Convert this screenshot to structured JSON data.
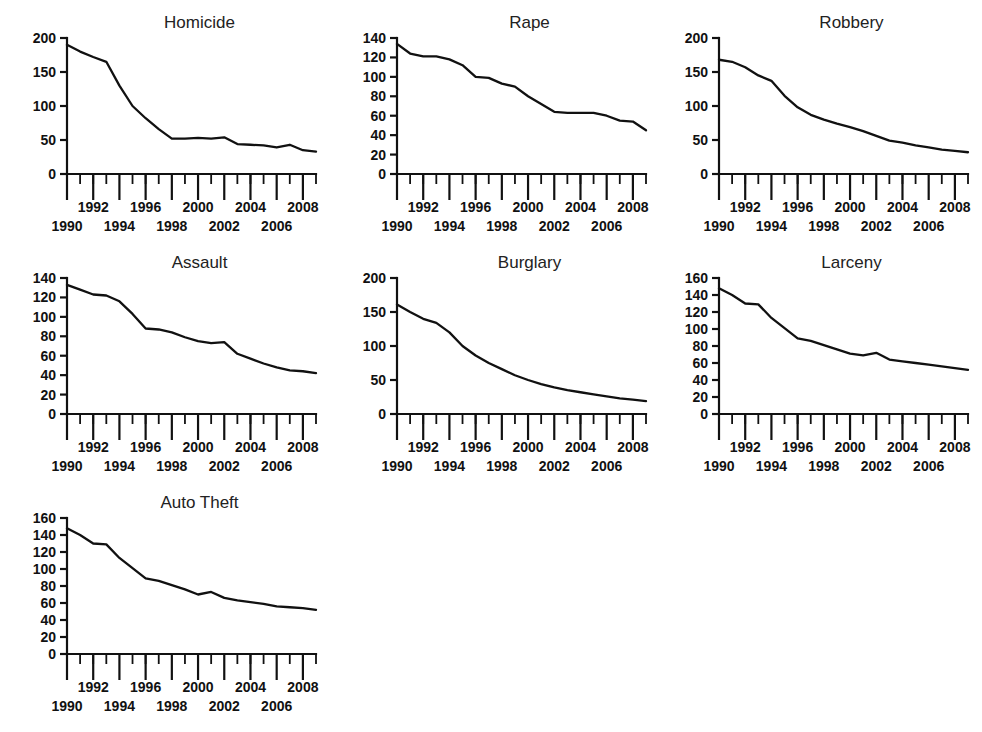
{
  "page": {
    "background": "#ffffff",
    "line_color": "#111111",
    "text_color": "#111111",
    "layout": "3-column grid of 7 small-multiple line charts"
  },
  "chart_data": [
    {
      "type": "line",
      "title": "Homicide",
      "xlabel": "",
      "ylabel": "",
      "xlim": [
        1990,
        2009
      ],
      "ylim": [
        0,
        200
      ],
      "yticks": [
        0,
        50,
        100,
        150,
        200
      ],
      "xticks_major": [
        1990,
        1992,
        1994,
        1996,
        1998,
        2000,
        2002,
        2004,
        2006,
        2008
      ],
      "xtick_labels_upper": [
        "1992",
        "1996",
        "2000",
        "2004",
        "2008"
      ],
      "xtick_labels_lower": [
        "1990",
        "1994",
        "1998",
        "2002",
        "2006"
      ],
      "grid": false,
      "legend": "none",
      "x": [
        1990,
        1991,
        1992,
        1993,
        1994,
        1995,
        1996,
        1997,
        1998,
        1999,
        2000,
        2001,
        2002,
        2003,
        2004,
        2005,
        2006,
        2007,
        2008,
        2009
      ],
      "values": [
        190,
        180,
        172,
        165,
        130,
        100,
        82,
        66,
        52,
        52,
        53,
        52,
        54,
        44,
        43,
        42,
        39,
        43,
        35,
        33
      ]
    },
    {
      "type": "line",
      "title": "Rape",
      "xlabel": "",
      "ylabel": "",
      "xlim": [
        1990,
        2009
      ],
      "ylim": [
        0,
        140
      ],
      "yticks": [
        0,
        20,
        40,
        60,
        80,
        100,
        120,
        140
      ],
      "xticks_major": [
        1990,
        1992,
        1994,
        1996,
        1998,
        2000,
        2002,
        2004,
        2006,
        2008
      ],
      "xtick_labels_upper": [
        "1992",
        "1996",
        "2000",
        "2004",
        "2008"
      ],
      "xtick_labels_lower": [
        "1990",
        "1994",
        "1998",
        "2002",
        "2006"
      ],
      "grid": false,
      "legend": "none",
      "x": [
        1990,
        1991,
        1992,
        1993,
        1994,
        1995,
        1996,
        1997,
        1998,
        1999,
        2000,
        2001,
        2002,
        2003,
        2004,
        2005,
        2006,
        2007,
        2008,
        2009
      ],
      "values": [
        134,
        124,
        121,
        121,
        118,
        112,
        100,
        99,
        93,
        90,
        80,
        72,
        64,
        63,
        63,
        63,
        60,
        55,
        54,
        45
      ]
    },
    {
      "type": "line",
      "title": "Robbery",
      "xlabel": "",
      "ylabel": "",
      "xlim": [
        1990,
        2009
      ],
      "ylim": [
        0,
        200
      ],
      "yticks": [
        0,
        50,
        100,
        150,
        200
      ],
      "xticks_major": [
        1990,
        1992,
        1994,
        1996,
        1998,
        2000,
        2002,
        2004,
        2006,
        2008
      ],
      "xtick_labels_upper": [
        "1992",
        "1996",
        "2000",
        "2004",
        "2008"
      ],
      "xtick_labels_lower": [
        "1990",
        "1994",
        "1998",
        "2002",
        "2006"
      ],
      "grid": false,
      "legend": "none",
      "x": [
        1990,
        1991,
        1992,
        1993,
        1994,
        1995,
        1996,
        1997,
        1998,
        1999,
        2000,
        2001,
        2002,
        2003,
        2004,
        2005,
        2006,
        2007,
        2008,
        2009
      ],
      "values": [
        168,
        165,
        157,
        145,
        137,
        115,
        98,
        87,
        80,
        74,
        69,
        63,
        56,
        49,
        46,
        42,
        39,
        36,
        34,
        32
      ]
    },
    {
      "type": "line",
      "title": "Assault",
      "xlabel": "",
      "ylabel": "",
      "xlim": [
        1990,
        2009
      ],
      "ylim": [
        0,
        140
      ],
      "yticks": [
        0,
        20,
        40,
        60,
        80,
        100,
        120,
        140
      ],
      "xticks_major": [
        1990,
        1992,
        1994,
        1996,
        1998,
        2000,
        2002,
        2004,
        2006,
        2008
      ],
      "xtick_labels_upper": [
        "1992",
        "1996",
        "2000",
        "2004",
        "2008"
      ],
      "xtick_labels_lower": [
        "1990",
        "1994",
        "1998",
        "2002",
        "2006"
      ],
      "grid": false,
      "legend": "none",
      "x": [
        1990,
        1991,
        1992,
        1993,
        1994,
        1995,
        1996,
        1997,
        1998,
        1999,
        2000,
        2001,
        2002,
        2003,
        2004,
        2005,
        2006,
        2007,
        2008,
        2009
      ],
      "values": [
        133,
        128,
        123,
        122,
        116,
        103,
        88,
        87,
        84,
        79,
        75,
        73,
        74,
        62,
        57,
        52,
        48,
        45,
        44,
        42
      ]
    },
    {
      "type": "line",
      "title": "Burglary",
      "xlabel": "",
      "ylabel": "",
      "xlim": [
        1990,
        2009
      ],
      "ylim": [
        0,
        200
      ],
      "yticks": [
        0,
        50,
        100,
        150,
        200
      ],
      "xticks_major": [
        1990,
        1992,
        1994,
        1996,
        1998,
        2000,
        2002,
        2004,
        2006,
        2008
      ],
      "xtick_labels_upper": [
        "1992",
        "1996",
        "2000",
        "2004",
        "2008"
      ],
      "xtick_labels_lower": [
        "1990",
        "1994",
        "1998",
        "2002",
        "2006"
      ],
      "grid": false,
      "legend": "none",
      "x": [
        1990,
        1991,
        1992,
        1993,
        1994,
        1995,
        1996,
        1997,
        1998,
        1999,
        2000,
        2001,
        2002,
        2003,
        2004,
        2005,
        2006,
        2007,
        2008,
        2009
      ],
      "values": [
        161,
        150,
        140,
        134,
        120,
        100,
        86,
        75,
        66,
        57,
        50,
        44,
        39,
        35,
        32,
        29,
        26,
        23,
        21,
        19
      ]
    },
    {
      "type": "line",
      "title": "Larceny",
      "xlabel": "",
      "ylabel": "",
      "xlim": [
        1990,
        2009
      ],
      "ylim": [
        0,
        160
      ],
      "yticks": [
        0,
        20,
        40,
        60,
        80,
        100,
        120,
        140,
        160
      ],
      "xticks_major": [
        1990,
        1992,
        1994,
        1996,
        1998,
        2000,
        2002,
        2004,
        2006,
        2008
      ],
      "xtick_labels_upper": [
        "1992",
        "1996",
        "2000",
        "2004",
        "2008"
      ],
      "xtick_labels_lower": [
        "1990",
        "1994",
        "1998",
        "2002",
        "2006"
      ],
      "grid": false,
      "legend": "none",
      "x": [
        1990,
        1991,
        1992,
        1993,
        1994,
        1995,
        1996,
        1997,
        1998,
        1999,
        2000,
        2001,
        2002,
        2003,
        2004,
        2005,
        2006,
        2007,
        2008,
        2009
      ],
      "values": [
        148,
        140,
        130,
        129,
        113,
        101,
        89,
        86,
        81,
        76,
        71,
        69,
        72,
        64,
        62,
        60,
        58,
        56,
        54,
        52
      ]
    },
    {
      "type": "line",
      "title": "Auto Theft",
      "xlabel": "",
      "ylabel": "",
      "xlim": [
        1990,
        2009
      ],
      "ylim": [
        0,
        160
      ],
      "yticks": [
        0,
        20,
        40,
        60,
        80,
        100,
        120,
        140,
        160
      ],
      "xticks_major": [
        1990,
        1992,
        1994,
        1996,
        1998,
        2000,
        2002,
        2004,
        2006,
        2008
      ],
      "xtick_labels_upper": [
        "1992",
        "1996",
        "2000",
        "2004",
        "2008"
      ],
      "xtick_labels_lower": [
        "1990",
        "1994",
        "1998",
        "2002",
        "2006"
      ],
      "grid": false,
      "legend": "none",
      "x": [
        1990,
        1991,
        1992,
        1993,
        1994,
        1995,
        1996,
        1997,
        1998,
        1999,
        2000,
        2001,
        2002,
        2003,
        2004,
        2005,
        2006,
        2007,
        2008,
        2009
      ],
      "values": [
        148,
        140,
        130,
        129,
        113,
        101,
        89,
        86,
        81,
        76,
        70,
        73,
        66,
        63,
        61,
        59,
        56,
        55,
        54,
        52
      ]
    }
  ]
}
